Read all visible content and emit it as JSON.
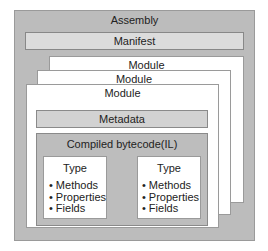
{
  "assembly": {
    "title": "Assembly",
    "manifest": "Manifest",
    "modules": [
      {
        "label": "Module"
      },
      {
        "label": "Module"
      },
      {
        "label": "Module"
      }
    ],
    "front_module": {
      "metadata": "Metadata",
      "compiled": {
        "title": "Compiled bytecode(IL)",
        "types": [
          {
            "title": "Type",
            "members": [
              "Methods",
              "Properties",
              "Fields"
            ]
          },
          {
            "title": "Type",
            "members": [
              "Methods",
              "Properties",
              "Fields"
            ]
          }
        ]
      }
    }
  },
  "colors": {
    "assembly_fill": "#bcbcbc",
    "manifest_fill": "#dcdcdc",
    "module_fill": "#ffffff",
    "metadata_fill": "#d2d2d2",
    "compiled_fill": "#bdbdbd"
  }
}
